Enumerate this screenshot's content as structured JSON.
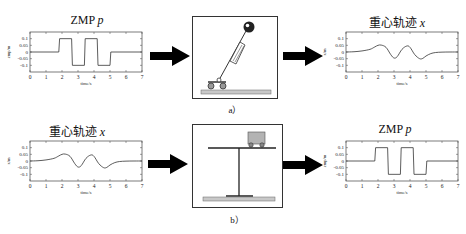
{
  "row_a": {
    "input_plot": {
      "title_main": "ZMP",
      "title_var": "p",
      "ylabel": "zmp/m",
      "xlabel": "time/s"
    },
    "model_caption": "a）",
    "model_name": "cart-table / inverted pendulum model",
    "output_plot": {
      "title_main": "重心轨迹",
      "title_var": "x",
      "ylabel": "x/m",
      "xlabel": "time/s"
    }
  },
  "row_b": {
    "input_plot": {
      "title_main": "重心轨迹",
      "title_var": "x",
      "ylabel": "x/m",
      "xlabel": "time/s"
    },
    "model_caption": "b）",
    "model_name": "cart-table model",
    "output_plot": {
      "title_main": "ZMP",
      "title_var": "p",
      "ylabel": "zmp/m",
      "xlabel": "time/s"
    }
  },
  "colors": {
    "line": "#333333",
    "arrow": "#000000",
    "ground": "#c8c8c8",
    "cart": "#b3b3b3"
  },
  "chart_data": [
    {
      "id": "zmp-a",
      "type": "line",
      "title": "ZMP p",
      "xlabel": "time/s",
      "ylabel": "zmp/m",
      "xlim": [
        0,
        7
      ],
      "ylim": [
        -0.15,
        0.15
      ],
      "xticks": [
        0,
        1,
        2,
        3,
        4,
        5,
        6,
        7
      ],
      "yticks": [
        0.1,
        0.05,
        0,
        -0.05,
        -0.1
      ],
      "x": [
        0,
        1.8,
        1.85,
        2.6,
        2.65,
        3.4,
        3.45,
        4.2,
        4.25,
        5.0,
        5.05,
        7
      ],
      "y": [
        0,
        0,
        0.1,
        0.1,
        -0.1,
        -0.1,
        0.1,
        0.1,
        -0.1,
        -0.1,
        0,
        0
      ]
    },
    {
      "id": "com-a",
      "type": "line",
      "title": "重心轨迹 x",
      "xlabel": "time/s",
      "ylabel": "x/m",
      "xlim": [
        0,
        7
      ],
      "ylim": [
        -0.15,
        0.15
      ],
      "xticks": [
        0,
        1,
        2,
        3,
        4,
        5,
        6,
        7
      ],
      "yticks": [
        0.1,
        0.05,
        0,
        -0.05,
        -0.1
      ],
      "x": [
        0,
        0.5,
        1.0,
        1.5,
        1.8,
        2.0,
        2.2,
        2.5,
        2.8,
        3.0,
        3.2,
        3.5,
        3.8,
        4.0,
        4.3,
        4.6,
        4.8,
        5.0,
        5.3,
        5.6,
        6.0,
        6.5,
        7
      ],
      "y": [
        0,
        0.002,
        0.008,
        0.02,
        0.038,
        0.05,
        0.052,
        0.035,
        -0.02,
        -0.045,
        -0.035,
        0.02,
        0.045,
        0.035,
        -0.02,
        -0.05,
        -0.048,
        -0.03,
        -0.012,
        -0.004,
        -0.001,
        0,
        0
      ]
    },
    {
      "id": "com-b",
      "type": "line",
      "title": "重心轨迹 x",
      "xlabel": "time/s",
      "ylabel": "x/m",
      "xlim": [
        0,
        7
      ],
      "ylim": [
        -0.15,
        0.15
      ],
      "xticks": [
        0,
        1,
        2,
        3,
        4,
        5,
        6,
        7
      ],
      "yticks": [
        0.1,
        0.05,
        0,
        -0.05,
        -0.1
      ],
      "x": [
        0,
        0.5,
        1.0,
        1.5,
        1.8,
        2.0,
        2.2,
        2.5,
        2.8,
        3.0,
        3.2,
        3.5,
        3.8,
        4.0,
        4.3,
        4.6,
        4.8,
        5.0,
        5.3,
        5.6,
        6.0,
        6.5,
        7
      ],
      "y": [
        0,
        0.002,
        0.008,
        0.02,
        0.038,
        0.05,
        0.052,
        0.035,
        -0.02,
        -0.045,
        -0.035,
        0.02,
        0.045,
        0.035,
        -0.02,
        -0.05,
        -0.048,
        -0.03,
        -0.012,
        -0.004,
        -0.001,
        0,
        0
      ]
    },
    {
      "id": "zmp-b",
      "type": "line",
      "title": "ZMP p",
      "xlabel": "time/s",
      "ylabel": "zmp/m",
      "xlim": [
        0,
        7
      ],
      "ylim": [
        -0.15,
        0.15
      ],
      "xticks": [
        0,
        1,
        2,
        3,
        4,
        5,
        6,
        7
      ],
      "yticks": [
        0.1,
        0.05,
        0,
        -0.05,
        -0.1
      ],
      "x": [
        0,
        1.8,
        1.85,
        2.6,
        2.65,
        3.4,
        3.45,
        4.2,
        4.25,
        5.0,
        5.05,
        7
      ],
      "y": [
        0,
        0,
        0.1,
        0.1,
        -0.1,
        -0.1,
        0.1,
        0.1,
        -0.1,
        -0.1,
        0,
        0
      ]
    }
  ]
}
